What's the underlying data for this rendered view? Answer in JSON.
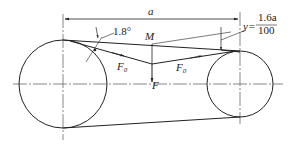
{
  "diagram": {
    "type": "belt-drive-tension-diagram",
    "labels": {
      "center_distance": "a",
      "angle": "1.8°",
      "point": "M",
      "tension_left": "F",
      "tension_left_sub": "0",
      "tension_right": "F",
      "tension_right_sub": "0",
      "force": "F",
      "deflection_var": "y=",
      "deflection_num": "1.6a",
      "deflection_den": "100"
    },
    "colors": {
      "line": "#222222",
      "centerline": "#555555",
      "background": "#ffffff"
    }
  }
}
